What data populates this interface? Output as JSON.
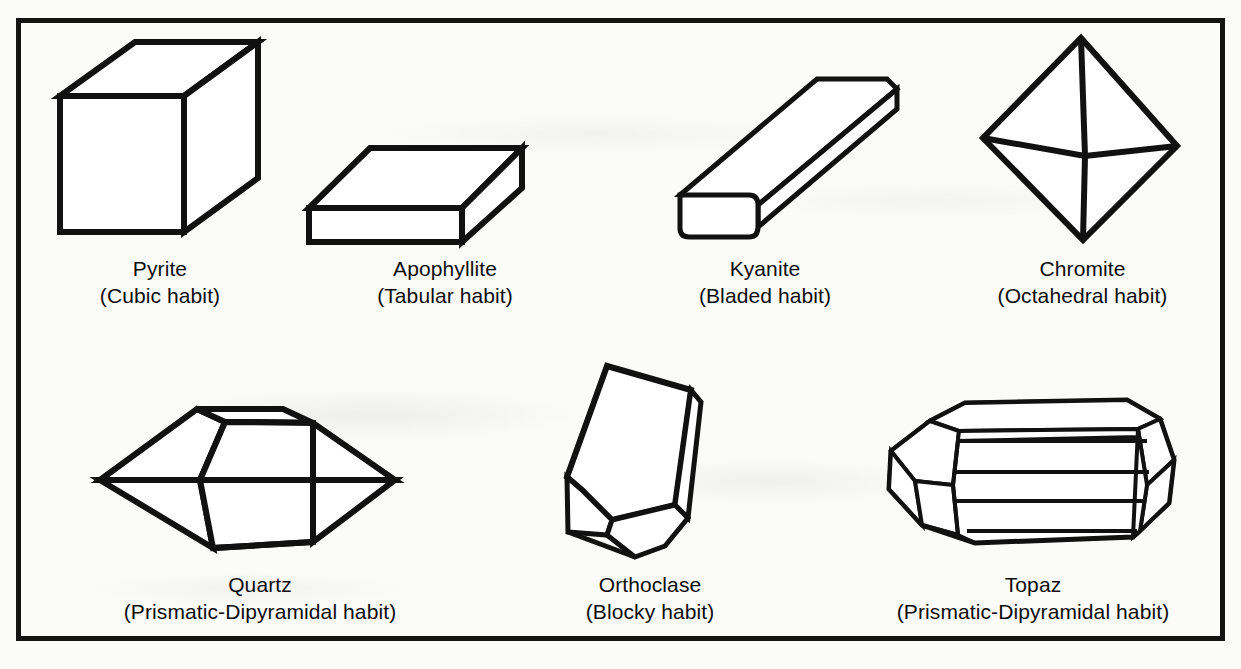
{
  "figure": {
    "border_color": "#141414",
    "background_color": "#fbfbf9",
    "ink_color": "#111111",
    "specimens": [
      {
        "id": "pyrite",
        "mineral": "Pyrite",
        "habit": "(Cubic habit)",
        "shape": "cube",
        "row": 1,
        "column": 1
      },
      {
        "id": "apophyllite",
        "mineral": "Apophyllite",
        "habit": "(Tabular habit)",
        "shape": "tabular-slab",
        "row": 1,
        "column": 2
      },
      {
        "id": "kyanite",
        "mineral": "Kyanite",
        "habit": "(Bladed habit)",
        "shape": "bladed-prism",
        "row": 1,
        "column": 3
      },
      {
        "id": "chromite",
        "mineral": "Chromite",
        "habit": "(Octahedral habit)",
        "shape": "octahedron",
        "row": 1,
        "column": 4
      },
      {
        "id": "quartz",
        "mineral": "Quartz",
        "habit": "(Prismatic-Dipyramidal habit)",
        "shape": "prismatic-dipyramid",
        "row": 2,
        "column": 1
      },
      {
        "id": "orthoclase",
        "mineral": "Orthoclase",
        "habit": "(Blocky habit)",
        "shape": "blocky-prism",
        "row": 2,
        "column": 2
      },
      {
        "id": "topaz",
        "mineral": "Topaz",
        "habit": "(Prismatic-Dipyramidal habit)",
        "shape": "multifaceted-prism",
        "row": 2,
        "column": 3
      }
    ]
  }
}
